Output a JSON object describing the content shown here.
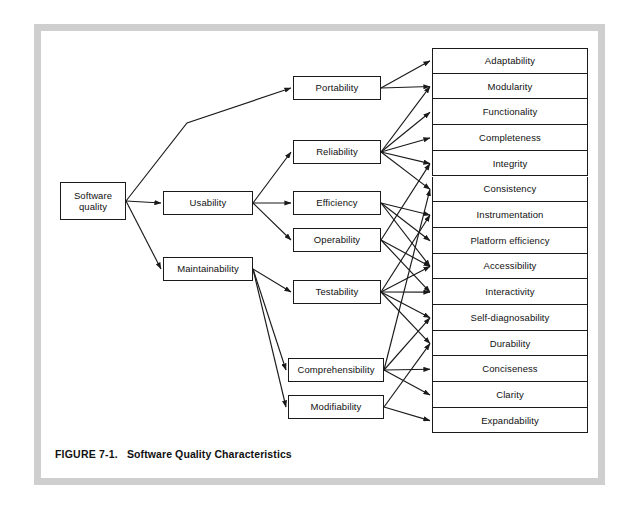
{
  "figure": {
    "caption_label": "FIGURE 7-1.",
    "caption_title": "Software Quality Characteristics",
    "root": {
      "label": "Software\nquality"
    }
  },
  "colors": {
    "line": "#1a1a1a",
    "box_border": "#1a1a1a",
    "box_fill": "#ffffff",
    "page_frame": "#cfcfcf",
    "text": "#111111",
    "background": "#ffffff"
  },
  "chart_data": {
    "type": "diagram",
    "title": "Software Quality Characteristics",
    "orientation": "left-to-right hierarchy",
    "levels": [
      {
        "name": "root",
        "nodes": [
          "Software quality"
        ]
      },
      {
        "name": "factors",
        "nodes": [
          "Usability",
          "Maintainability"
        ]
      },
      {
        "name": "criteria",
        "nodes": [
          "Portability",
          "Reliability",
          "Efficiency",
          "Operability",
          "Testability",
          "Comprehensibility",
          "Modifiability"
        ]
      },
      {
        "name": "metrics",
        "nodes": [
          "Adaptability",
          "Modularity",
          "Functionality",
          "Completeness",
          "Integrity",
          "Consistency",
          "Instrumentation",
          "Platform efficiency",
          "Accessibility",
          "Interactivity",
          "Self-diagnosability",
          "Durability",
          "Conciseness",
          "Clarity",
          "Expandability"
        ]
      }
    ],
    "edges": [
      {
        "from": "Software quality",
        "to": "Portability"
      },
      {
        "from": "Software quality",
        "to": "Usability"
      },
      {
        "from": "Software quality",
        "to": "Maintainability"
      },
      {
        "from": "Usability",
        "to": "Reliability"
      },
      {
        "from": "Usability",
        "to": "Efficiency"
      },
      {
        "from": "Usability",
        "to": "Operability"
      },
      {
        "from": "Maintainability",
        "to": "Testability"
      },
      {
        "from": "Maintainability",
        "to": "Comprehensibility"
      },
      {
        "from": "Maintainability",
        "to": "Modifiability"
      },
      {
        "from": "Portability",
        "to": "Adaptability"
      },
      {
        "from": "Portability",
        "to": "Modularity"
      },
      {
        "from": "Reliability",
        "to": "Modularity"
      },
      {
        "from": "Reliability",
        "to": "Functionality"
      },
      {
        "from": "Reliability",
        "to": "Completeness"
      },
      {
        "from": "Reliability",
        "to": "Integrity"
      },
      {
        "from": "Reliability",
        "to": "Consistency"
      },
      {
        "from": "Efficiency",
        "to": "Instrumentation"
      },
      {
        "from": "Efficiency",
        "to": "Platform efficiency"
      },
      {
        "from": "Efficiency",
        "to": "Accessibility"
      },
      {
        "from": "Operability",
        "to": "Integrity"
      },
      {
        "from": "Operability",
        "to": "Accessibility"
      },
      {
        "from": "Operability",
        "to": "Interactivity"
      },
      {
        "from": "Testability",
        "to": "Instrumentation"
      },
      {
        "from": "Testability",
        "to": "Accessibility"
      },
      {
        "from": "Testability",
        "to": "Interactivity"
      },
      {
        "from": "Testability",
        "to": "Self-diagnosability"
      },
      {
        "from": "Testability",
        "to": "Durability"
      },
      {
        "from": "Comprehensibility",
        "to": "Consistency"
      },
      {
        "from": "Comprehensibility",
        "to": "Self-diagnosability"
      },
      {
        "from": "Comprehensibility",
        "to": "Conciseness"
      },
      {
        "from": "Comprehensibility",
        "to": "Clarity"
      },
      {
        "from": "Modifiability",
        "to": "Durability"
      },
      {
        "from": "Modifiability",
        "to": "Expandability"
      }
    ]
  },
  "nodes": {
    "root": {
      "label": "Software\nquality",
      "line1": "Software",
      "line2": "quality"
    },
    "factors": [
      {
        "id": "usability",
        "label": "Usability"
      },
      {
        "id": "maintainability",
        "label": "Maintainability"
      }
    ],
    "criteria": [
      {
        "id": "portability",
        "label": "Portability"
      },
      {
        "id": "reliability",
        "label": "Reliability"
      },
      {
        "id": "efficiency",
        "label": "Efficiency"
      },
      {
        "id": "operability",
        "label": "Operability"
      },
      {
        "id": "testability",
        "label": "Testability"
      },
      {
        "id": "comprehensibility",
        "label": "Comprehensibility"
      },
      {
        "id": "modifiability",
        "label": "Modifiability"
      }
    ],
    "metrics": [
      {
        "id": "adaptability",
        "label": "Adaptability"
      },
      {
        "id": "modularity",
        "label": "Modularity"
      },
      {
        "id": "functionality",
        "label": "Functionality"
      },
      {
        "id": "completeness",
        "label": "Completeness"
      },
      {
        "id": "integrity",
        "label": "Integrity"
      },
      {
        "id": "consistency",
        "label": "Consistency"
      },
      {
        "id": "instrumentation",
        "label": "Instrumentation"
      },
      {
        "id": "platform-efficiency",
        "label": "Platform efficiency"
      },
      {
        "id": "accessibility",
        "label": "Accessibility"
      },
      {
        "id": "interactivity",
        "label": "Interactivity"
      },
      {
        "id": "self-diagnosability",
        "label": "Self-diagnosability"
      },
      {
        "id": "durability",
        "label": "Durability"
      },
      {
        "id": "conciseness",
        "label": "Conciseness"
      },
      {
        "id": "clarity",
        "label": "Clarity"
      },
      {
        "id": "expandability",
        "label": "Expandability"
      }
    ]
  }
}
